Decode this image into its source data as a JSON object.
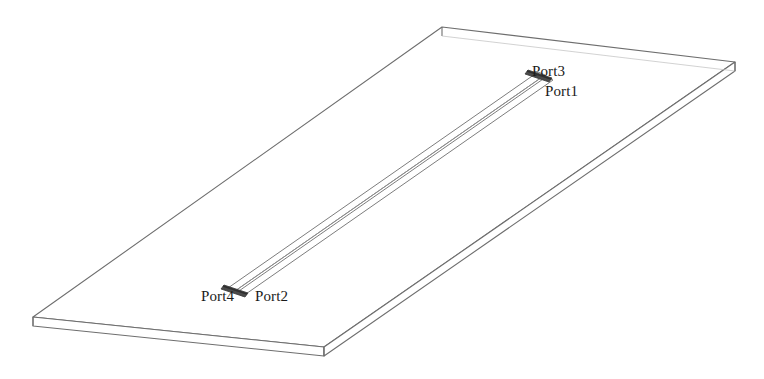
{
  "figure": {
    "type": "3d-line-drawing",
    "background_color": "#ffffff",
    "outline_color": "#6e6e6e",
    "strip_color": "#8a8a8a",
    "endcap_color": "#4a4a4a",
    "label_color": "#1a1a1a",
    "canvas": {
      "width": 764,
      "height": 379
    }
  },
  "substrate": {
    "name": "dielectric-substrate-slab",
    "thickness_px": 9,
    "top_face_corners": [
      {
        "x": 442,
        "y": 27
      },
      {
        "x": 735,
        "y": 62
      },
      {
        "x": 324,
        "y": 347
      },
      {
        "x": 33,
        "y": 317
      }
    ]
  },
  "coupled_lines": {
    "name": "coupled-microstrip-pair",
    "line_count": 2,
    "start_end": {
      "x": 232,
      "y": 292
    },
    "far_end": {
      "x": 545,
      "y": 76
    }
  },
  "ports": [
    {
      "id": "port3",
      "label": "Port3",
      "location": "far-end-outer"
    },
    {
      "id": "port1",
      "label": "Port1",
      "location": "far-end-inner"
    },
    {
      "id": "port4",
      "label": "Port4",
      "location": "near-end-outer"
    },
    {
      "id": "port2",
      "label": "Port2",
      "location": "near-end-inner"
    }
  ]
}
